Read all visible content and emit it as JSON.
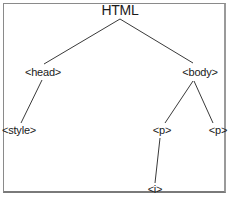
{
  "diagram": {
    "type": "tree",
    "title": "HTML",
    "nodes": [
      {
        "id": "html",
        "label": "HTML",
        "x": 120,
        "y": 10
      },
      {
        "id": "head",
        "label": "<head>",
        "x": 43,
        "y": 72
      },
      {
        "id": "body",
        "label": "<body>",
        "x": 200,
        "y": 72
      },
      {
        "id": "style",
        "label": "<style>",
        "x": 19,
        "y": 130
      },
      {
        "id": "p1",
        "label": "<p>",
        "x": 162,
        "y": 130
      },
      {
        "id": "p2",
        "label": "<p>",
        "x": 218,
        "y": 130
      },
      {
        "id": "i",
        "label": "<i>",
        "x": 155,
        "y": 190
      }
    ],
    "edges": [
      {
        "from": "html",
        "to": "head"
      },
      {
        "from": "html",
        "to": "body"
      },
      {
        "from": "head",
        "to": "style"
      },
      {
        "from": "body",
        "to": "p1"
      },
      {
        "from": "body",
        "to": "p2"
      },
      {
        "from": "p1",
        "to": "i"
      }
    ],
    "colors": {
      "line": "#3a3a3a",
      "text": "#1a1a1a",
      "border": "#8a8a8a"
    }
  }
}
